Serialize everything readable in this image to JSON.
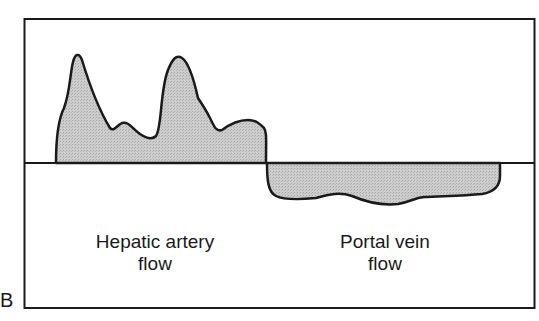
{
  "panel": {
    "letter": "B"
  },
  "diagram": {
    "labels": {
      "hepatic_line1": "Hepatic artery",
      "hepatic_line2": "flow",
      "portal_line1": "Portal vein",
      "portal_line2": "flow"
    },
    "colors": {
      "fill": "#c8c8c8",
      "stroke": "#1a1a1a",
      "frame": "#1a1a1a"
    }
  }
}
